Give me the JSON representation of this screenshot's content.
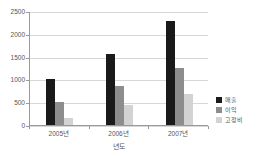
{
  "chart_data": {
    "type": "bar",
    "title": "",
    "subtitle": "",
    "xlabel": "년도",
    "ylabel": "",
    "categories": [
      "2005년",
      "2006년",
      "2007년"
    ],
    "series": [
      {
        "name": "매출",
        "color": "#1a1a1a",
        "values": [
          1000,
          1550,
          2280
        ]
      },
      {
        "name": "이익",
        "color": "#8d8d8d",
        "values": [
          500,
          850,
          1250
        ]
      },
      {
        "name": "고정비",
        "color": "#d3d3d3",
        "values": [
          150,
          430,
          690
        ]
      }
    ],
    "ylim": [
      0,
      2500
    ],
    "yticks": [
      0,
      500,
      1000,
      1500,
      2000,
      2500
    ],
    "ytick_labels": [
      "0",
      "500",
      "1000",
      "1500",
      "2000",
      "2500"
    ],
    "grid": true,
    "grid_axis": "y",
    "legend_position": "right",
    "background": "#ffffff",
    "axis_color": "#9a9a9a",
    "grid_color": "#d8d8d8"
  }
}
